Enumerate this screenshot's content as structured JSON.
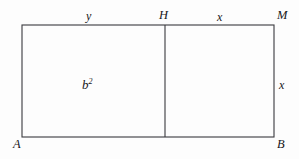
{
  "figure": {
    "background_color": "#fdfdfd",
    "stroke_color": "#3a3a3e",
    "text_color": "#17171a",
    "rectangle": {
      "left": 22,
      "top": 25,
      "right": 274,
      "bottom": 137,
      "width": 252,
      "height": 112
    },
    "divider": {
      "x": 165,
      "from_y": 25,
      "to_y": 137
    },
    "labels": {
      "top_left_segment": "y",
      "top_divider_point": "H",
      "top_right_segment": "x",
      "top_right_corner": "M",
      "right_side": "x",
      "interior_area": "b",
      "interior_area_exponent": "2",
      "bottom_left_corner": "A",
      "bottom_right_corner": "B"
    }
  }
}
